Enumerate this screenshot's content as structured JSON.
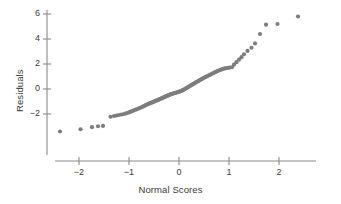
{
  "chart_data": {
    "type": "scatter",
    "title": "",
    "xlabel": "Normal Scores",
    "ylabel": "Residuals",
    "xlim": [
      -2.6,
      2.7
    ],
    "ylim": [
      -3.6,
      6.4
    ],
    "xticks": [
      -2,
      -1,
      0,
      1,
      2
    ],
    "xticklabels": [
      "−2",
      "−1",
      "0",
      "1",
      "2"
    ],
    "yticks": [
      -2,
      0,
      2,
      4,
      6
    ],
    "yticklabels": [
      "−2",
      "0",
      "2",
      "4",
      "6"
    ],
    "grid": false,
    "legend": null,
    "marker": {
      "shape": "circle",
      "size": 3,
      "color": "#7d7d7d"
    },
    "axis_color": "#8a8a8a",
    "text_color": "#3b3b3b",
    "background": "#ffffff",
    "series": [
      {
        "name": "Residuals vs Normal Scores",
        "x": [
          -2.38,
          -1.97,
          -1.74,
          -1.62,
          -1.52,
          -1.37,
          -1.3,
          -1.25,
          -1.2,
          -1.15,
          -1.1,
          -1.06,
          -1.02,
          -0.99,
          -0.96,
          -0.93,
          -0.9,
          -0.87,
          -0.85,
          -0.82,
          -0.8,
          -0.77,
          -0.75,
          -0.73,
          -0.71,
          -0.69,
          -0.67,
          -0.65,
          -0.63,
          -0.61,
          -0.59,
          -0.57,
          -0.55,
          -0.53,
          -0.51,
          -0.49,
          -0.47,
          -0.46,
          -0.44,
          -0.42,
          -0.4,
          -0.39,
          -0.37,
          -0.35,
          -0.33,
          -0.32,
          -0.3,
          -0.28,
          -0.27,
          -0.25,
          -0.23,
          -0.22,
          -0.2,
          -0.18,
          -0.17,
          -0.15,
          -0.13,
          -0.12,
          -0.1,
          -0.08,
          -0.07,
          -0.05,
          -0.03,
          -0.02,
          0.0,
          0.02,
          0.03,
          0.05,
          0.07,
          0.08,
          0.1,
          0.12,
          0.13,
          0.15,
          0.17,
          0.18,
          0.2,
          0.22,
          0.23,
          0.25,
          0.27,
          0.28,
          0.3,
          0.32,
          0.33,
          0.35,
          0.37,
          0.39,
          0.4,
          0.42,
          0.44,
          0.46,
          0.47,
          0.49,
          0.51,
          0.53,
          0.55,
          0.57,
          0.59,
          0.61,
          0.63,
          0.65,
          0.67,
          0.69,
          0.71,
          0.73,
          0.75,
          0.77,
          0.8,
          0.82,
          0.85,
          0.87,
          0.9,
          0.93,
          0.96,
          0.99,
          1.02,
          1.06,
          1.1,
          1.15,
          1.2,
          1.25,
          1.3,
          1.37,
          1.45,
          1.52,
          1.62,
          1.74,
          1.97,
          2.38
        ],
        "y": [
          -3.4,
          -3.22,
          -3.05,
          -2.98,
          -2.95,
          -2.22,
          -2.16,
          -2.12,
          -2.08,
          -2.04,
          -2.0,
          -1.95,
          -1.9,
          -1.85,
          -1.8,
          -1.75,
          -1.7,
          -1.66,
          -1.62,
          -1.58,
          -1.54,
          -1.5,
          -1.46,
          -1.42,
          -1.38,
          -1.34,
          -1.3,
          -1.26,
          -1.22,
          -1.18,
          -1.15,
          -1.12,
          -1.09,
          -1.06,
          -1.02,
          -0.99,
          -0.96,
          -0.93,
          -0.9,
          -0.87,
          -0.84,
          -0.81,
          -0.78,
          -0.75,
          -0.72,
          -0.69,
          -0.66,
          -0.63,
          -0.6,
          -0.57,
          -0.54,
          -0.51,
          -0.48,
          -0.45,
          -0.42,
          -0.4,
          -0.38,
          -0.36,
          -0.34,
          -0.32,
          -0.3,
          -0.28,
          -0.26,
          -0.24,
          -0.22,
          -0.2,
          -0.17,
          -0.14,
          -0.11,
          -0.08,
          -0.04,
          0.0,
          0.04,
          0.08,
          0.12,
          0.16,
          0.2,
          0.24,
          0.28,
          0.32,
          0.36,
          0.4,
          0.44,
          0.48,
          0.52,
          0.56,
          0.6,
          0.64,
          0.68,
          0.72,
          0.76,
          0.8,
          0.84,
          0.88,
          0.92,
          0.96,
          1.0,
          1.04,
          1.08,
          1.12,
          1.16,
          1.2,
          1.24,
          1.28,
          1.32,
          1.36,
          1.4,
          1.44,
          1.48,
          1.52,
          1.56,
          1.6,
          1.63,
          1.66,
          1.68,
          1.7,
          1.72,
          1.74,
          1.95,
          2.15,
          2.35,
          2.55,
          2.78,
          3.05,
          3.3,
          3.65,
          4.4,
          5.15,
          5.2,
          5.8
        ]
      }
    ]
  }
}
